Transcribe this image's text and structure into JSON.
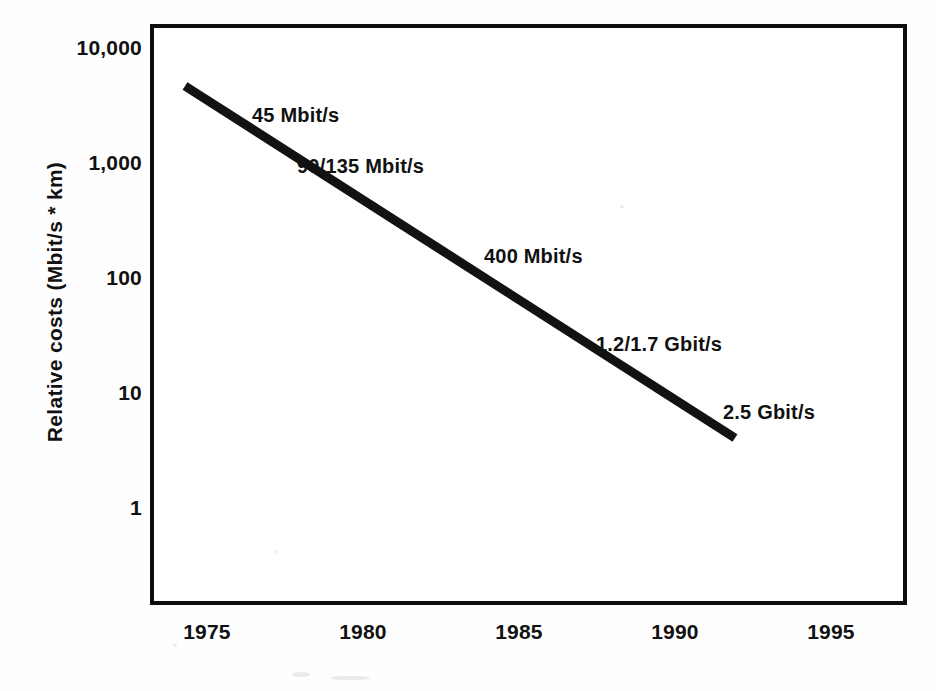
{
  "chart_data": {
    "type": "line",
    "title": "",
    "subtitle": "",
    "xlabel": "",
    "ylabel": "Relative costs (Mbit/s * km)",
    "xlim": [
      1973.3,
      1996.4
    ],
    "ylim": [
      1,
      10000
    ],
    "yscale": "log",
    "xscale": "linear",
    "grid": false,
    "legend": false,
    "legend_position": "none",
    "x_ticks": [
      "1975",
      "1980",
      "1985",
      "1990",
      "1995"
    ],
    "x_tick_values": [
      1975,
      1980,
      1985,
      1990,
      1995
    ],
    "y_ticks": [
      "10,000",
      "1,000",
      "100",
      "10",
      "1"
    ],
    "y_tick_values": [
      10000,
      1000,
      100,
      10,
      1
    ],
    "series": [
      {
        "name": "Relative transmission cost",
        "x": [
          1973.3,
          1990.9
        ],
        "values": [
          5000,
          4.5
        ]
      }
    ],
    "annotations": [
      {
        "label": "45 Mbit/s",
        "x": 1975.0,
        "y": 2000
      },
      {
        "label": "90/135 Mbit/s",
        "x": 1976.5,
        "y": 800
      },
      {
        "label": "400 Mbit/s",
        "x": 1984.0,
        "y": 130
      },
      {
        "label": "1.2/1.7 Gbit/s",
        "x": 1988.0,
        "y": 30
      },
      {
        "label": "2.5 Gbit/s",
        "x": 1991.5,
        "y": 7
      }
    ],
    "colors": {
      "line": "#121212",
      "axis": "#0d0d0d",
      "text": "#111111",
      "background": "#ffffff"
    }
  },
  "axes": {
    "y_title": "Relative costs (Mbit/s * km)",
    "y_tick_labels": [
      {
        "text": "10,000",
        "top": 36
      },
      {
        "text": "1,000",
        "top": 151
      },
      {
        "text": "100",
        "top": 266
      },
      {
        "text": "10",
        "top": 381
      },
      {
        "text": "1",
        "top": 496
      }
    ],
    "x_tick_labels": [
      {
        "text": "1975",
        "left": 207,
        "top": 620
      },
      {
        "text": "1980",
        "left": 363,
        "top": 620
      },
      {
        "text": "1985",
        "left": 519,
        "top": 620
      },
      {
        "text": "1990",
        "left": 675,
        "top": 620
      },
      {
        "text": "1995",
        "left": 831,
        "top": 620
      }
    ]
  },
  "annotations": [
    {
      "text": "45 Mbit/s",
      "left": 252,
      "top": 104
    },
    {
      "text": "90/135 Mbit/s",
      "left": 297,
      "top": 155
    },
    {
      "text": "400 Mbit/s",
      "left": 484,
      "top": 245
    },
    {
      "text": "1.2/1.7 Gbit/s",
      "left": 596,
      "top": 333
    },
    {
      "text": "2.5 Gbit/s",
      "left": 723,
      "top": 401
    }
  ],
  "line_geometry": {
    "x1": 185,
    "y1": 86,
    "x2": 735,
    "y2": 438,
    "stroke": "#121212",
    "stroke_width": 9
  }
}
